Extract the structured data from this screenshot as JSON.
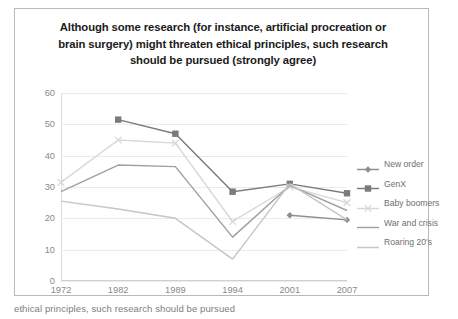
{
  "chart_data": {
    "type": "line",
    "title": "Although some research (for instance, artificial procreation or brain surgery) might threaten ethical principles, such research should be pursued (strongly agree)",
    "title_lines": [
      "Although some research (for instance, artificial procreation or",
      "brain surgery) might threaten ethical principles, such research",
      "should be pursued (strongly agree)"
    ],
    "xlabel": "",
    "ylabel": "",
    "categories": [
      "1972",
      "1982",
      "1989",
      "1994",
      "2001",
      "2007"
    ],
    "ylim": [
      0,
      60
    ],
    "yticks": [
      "0",
      "10",
      "20",
      "30",
      "40",
      "50",
      "60"
    ],
    "grid": "horizontal",
    "legend_position": "right",
    "series": [
      {
        "name": "New order",
        "color": "#8d8d8d",
        "marker": "diamond",
        "values": [
          null,
          null,
          null,
          null,
          21,
          19.5
        ]
      },
      {
        "name": "GenX",
        "color": "#7b7b7b",
        "marker": "square",
        "values": [
          null,
          51.5,
          47,
          28.5,
          31,
          28
        ]
      },
      {
        "name": "Baby boomers",
        "color": "#d8d8d8",
        "marker": "cross",
        "values": [
          31.5,
          45,
          44,
          19,
          30,
          25
        ]
      },
      {
        "name": "War and crisis",
        "color": "#a0a0a0",
        "marker": "none",
        "values": [
          28.5,
          37,
          36.5,
          14,
          30.5,
          22.5
        ]
      },
      {
        "name": "Roaring 20's",
        "color": "#c6c6c6",
        "marker": "none",
        "values": [
          25.5,
          23,
          20,
          7,
          31,
          19.5
        ]
      }
    ]
  },
  "caption": {
    "fragment": "ethical principles, such research should be pursued"
  }
}
